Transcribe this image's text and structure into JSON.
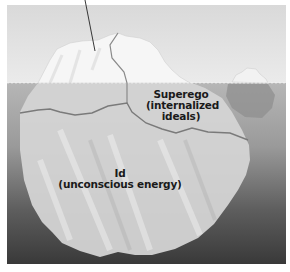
{
  "figure": {
    "type": "iceberg-model-of-mind",
    "pointer_label_cut_off": true
  },
  "labels": {
    "superego": {
      "name": "Superego",
      "description": "(internalized",
      "description_line2": "ideals)"
    },
    "id": {
      "name": "Id",
      "description": "(unconscious energy)"
    }
  },
  "colors": {
    "sky": "#e2e2e2",
    "water_top": "#b4b4b4",
    "water_bottom": "#3c3c3c",
    "ice_above": "#f4f4f4",
    "ice_below": "#d2d2d2",
    "division_line": "#7a7a7a",
    "text": "#1a1a1a"
  }
}
